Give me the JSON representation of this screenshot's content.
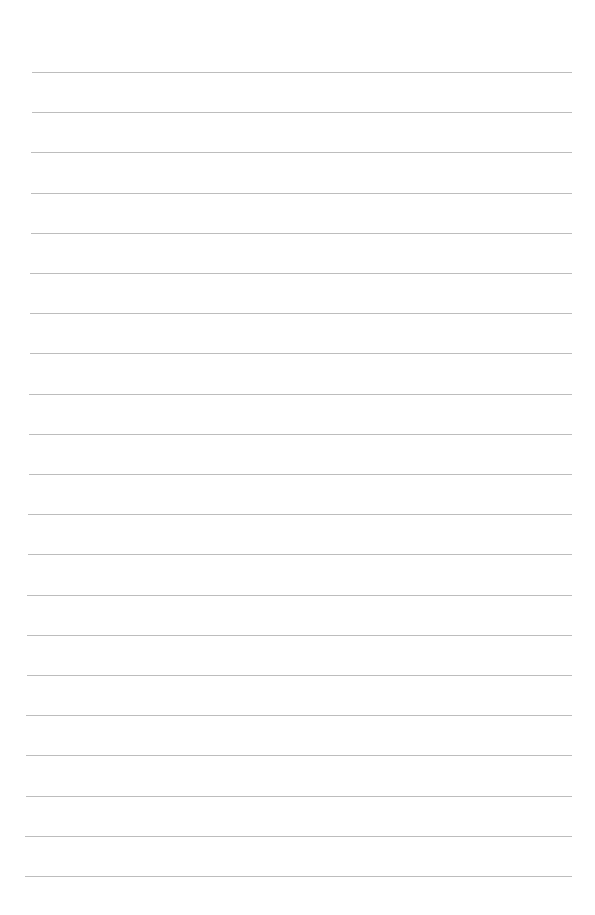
{
  "page": {
    "type": "ruled-paper",
    "background": "#ffffff",
    "rule_color": "#bdbdbd",
    "rule_count": 21,
    "first_rule_y": 72,
    "rule_spacing": 40.2,
    "rule_left_top": 32,
    "rule_left_bottom": 25,
    "rule_right": 572
  }
}
